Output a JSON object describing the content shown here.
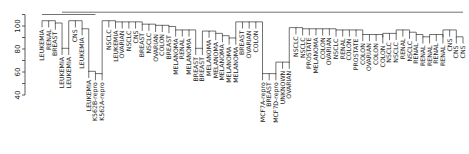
{
  "chart_data": {
    "type": "dendrogram",
    "title": "",
    "xlabel": "",
    "ylabel": "",
    "ylim": [
      35,
      115
    ],
    "yticks": [
      40,
      60,
      80,
      100
    ],
    "grid": false,
    "legend": null,
    "linkage_hint": "complete",
    "leaves": [
      "LEUKEMIA",
      "RENAL",
      "BREAST",
      "LEUKEMIA",
      "LEUKEMIA",
      "CNS",
      "LEUKEMIA",
      "LEUKEMIA",
      "K562B-repro",
      "K562A-repro",
      "NSCLC",
      "LEUKEMIA",
      "OVARIAN",
      "NSCLC",
      "CNS",
      "BREAST",
      "NSCLC",
      "OVARIAN",
      "COLON",
      "BREAST",
      "MELANOMA",
      "RENAL",
      "MELANOMA",
      "BREAST",
      "BREAST",
      "MELANOMA",
      "MELANOMA",
      "MELANOMA",
      "MELANOMA",
      "MELANOMA",
      "BREAST",
      "OVARIAN",
      "COLON",
      "MCF7A-repro",
      "BREAST",
      "MCF7D-repro",
      "UNKNOWN",
      "OVARIAN",
      "NSCLC",
      "NSCLC",
      "PROSTATE",
      "MELANOMA",
      "COLON",
      "OVARIAN",
      "NSCLC",
      "RENAL",
      "COLON",
      "PROSTATE",
      "COLON",
      "OVARIAN",
      "COLON",
      "COLON",
      "NSCLC",
      "NSCLC",
      "RENAL",
      "NSCLC",
      "RENAL",
      "RENAL",
      "RENAL",
      "RENAL",
      "RENAL",
      "CNS",
      "CNS",
      "CNS"
    ],
    "leaf_heights": [
      104,
      104,
      102,
      80,
      80,
      104,
      97,
      60,
      58,
      58,
      104,
      103,
      103,
      103,
      103,
      101,
      101,
      100,
      100,
      99,
      96,
      96,
      96,
      80,
      80,
      95,
      93,
      91,
      89,
      89,
      103,
      103,
      103,
      58,
      58,
      58,
      68,
      68,
      98,
      97,
      97,
      97,
      97,
      97,
      96,
      96,
      96,
      96,
      92,
      92,
      92,
      90,
      93,
      93,
      96,
      94,
      92,
      90,
      90,
      92,
      90,
      96,
      90,
      90
    ],
    "merges_approx": [
      {
        "leaves": [
          4,
          5
        ],
        "height": 80
      },
      {
        "leaves": [
          9,
          10
        ],
        "height": 60
      },
      {
        "leaves": [
          8,
          "9-10"
        ],
        "height": 68
      },
      {
        "leaves": [
          24,
          25
        ],
        "height": 80
      },
      {
        "leaves": [
          29,
          30
        ],
        "height": 91
      },
      {
        "leaves": [
          34,
          35,
          36
        ],
        "height": 62
      },
      {
        "leaves": [
          37,
          38
        ],
        "height": 72
      },
      {
        "leaves": [
          63,
          64
        ],
        "height": 92
      },
      {
        "leaves": "1-3",
        "height": 108
      },
      {
        "leaves": "1-10",
        "height": 110
      },
      {
        "leaves": "all",
        "height": 113
      }
    ]
  },
  "axis": {
    "tick_labels": [
      "40",
      "60",
      "80",
      "100"
    ]
  }
}
